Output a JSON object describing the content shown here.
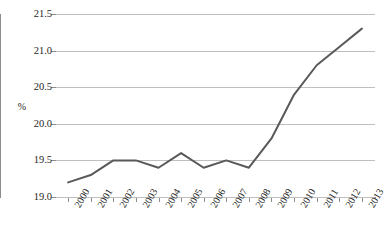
{
  "chart_data": {
    "type": "line",
    "title": "",
    "xlabel": "",
    "ylabel": "%",
    "categories": [
      "2000",
      "2001",
      "2002",
      "2003",
      "2004",
      "2005",
      "2006",
      "2007",
      "2008",
      "2009",
      "2010",
      "2011",
      "2012",
      "2013"
    ],
    "series": [
      {
        "name": "%",
        "values": [
          19.2,
          19.3,
          19.5,
          19.5,
          19.4,
          19.6,
          19.4,
          19.5,
          19.4,
          19.8,
          20.4,
          20.8,
          21.05,
          21.3
        ]
      }
    ],
    "ylim": [
      19.0,
      21.5
    ],
    "yticks": [
      "19.0",
      "19.5",
      "20.0",
      "20.5",
      "21.0",
      "21.5"
    ],
    "ytick_values": [
      19.0,
      19.5,
      20.0,
      20.5,
      21.0,
      21.5
    ],
    "grid": "horizontal",
    "legend": "none",
    "line_color": "#595959",
    "grid_color": "#bfbfbf",
    "axis_color": "#8c8c8c",
    "text_color": "#262626"
  }
}
